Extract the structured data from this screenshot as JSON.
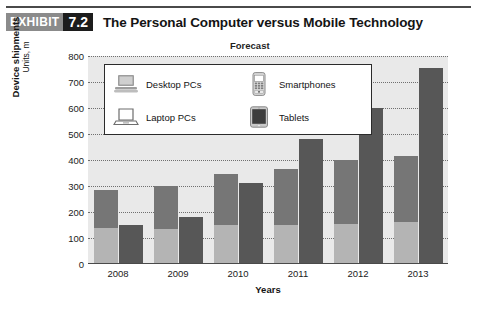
{
  "header": {
    "badge_word": "EXHIBIT",
    "badge_number": "7.2",
    "title": "The Personal Computer versus Mobile Technology"
  },
  "chart_data": {
    "type": "bar",
    "title": "The Personal Computer versus Mobile Technology",
    "annotation": "Forecast",
    "xlabel": "Years",
    "ylabel": "Device shipments",
    "ylabel_units": "Units, m",
    "categories": [
      "2008",
      "2009",
      "2010",
      "2011",
      "2012",
      "2013"
    ],
    "ylim": [
      0,
      800
    ],
    "yticks": [
      "800",
      "700",
      "600",
      "500",
      "400",
      "300",
      "200",
      "100",
      "0"
    ],
    "grid": true,
    "legend_position": "inside-top-left",
    "series": [
      {
        "name": "Desktop PCs",
        "icon": "desktop-computer-icon",
        "color": "#b4b4b4",
        "stack": "pc",
        "values": [
          140,
          135,
          150,
          150,
          155,
          160
        ]
      },
      {
        "name": "Laptop PCs",
        "icon": "laptop-icon",
        "color": "#767676",
        "stack": "pc",
        "values": [
          145,
          165,
          195,
          215,
          245,
          255
        ]
      },
      {
        "name": "Smartphones",
        "icon": "smartphone-icon",
        "color": "#575757",
        "stack": "mobile",
        "values": [
          150,
          180,
          310,
          480,
          600,
          755
        ]
      },
      {
        "name": "Tablets",
        "icon": "tablet-icon",
        "color": "#575757",
        "stack": "mobile",
        "values": [
          0,
          0,
          0,
          0,
          0,
          0
        ]
      }
    ],
    "stacked_totals_pc": [
      285,
      300,
      345,
      365,
      400,
      415
    ],
    "stacked_totals_mobile": [
      150,
      180,
      310,
      480,
      600,
      755
    ]
  },
  "legend": {
    "items": [
      {
        "label": "Desktop PCs",
        "icon": "desktop-computer-icon"
      },
      {
        "label": "Smartphones",
        "icon": "smartphone-icon"
      },
      {
        "label": "Laptop PCs",
        "icon": "laptop-icon"
      },
      {
        "label": "Tablets",
        "icon": "tablet-icon"
      }
    ]
  }
}
